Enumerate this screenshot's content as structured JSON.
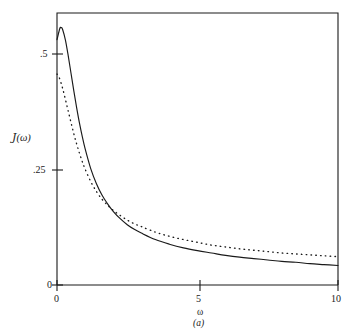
{
  "figure": {
    "caption": "(a)",
    "background_color": "#ffffff",
    "foreground_color": "#1a1a1a"
  },
  "axes": {
    "y_label_prefix": "J",
    "y_label_suffix": "(ω)",
    "x_label": "ω",
    "y_ticks": [
      {
        "value": 0,
        "label": "0"
      },
      {
        "value": 0.25,
        "label": ".25"
      },
      {
        "value": 0.5,
        "label": ".5"
      }
    ],
    "x_ticks": [
      {
        "value": 0,
        "label": "0"
      },
      {
        "value": 5,
        "label": "5"
      },
      {
        "value": 10,
        "label": "10"
      }
    ]
  },
  "chart_data": {
    "type": "line",
    "title": "",
    "subtitle": "(a)",
    "xlabel": "ω",
    "ylabel": "J(ω)",
    "xlim": [
      0,
      10
    ],
    "ylim": [
      0,
      0.5865
    ],
    "xticks": [
      0,
      5,
      10
    ],
    "xticklabels": [
      "0",
      "5",
      "10"
    ],
    "yticks": [
      0,
      0.25,
      0.5
    ],
    "yticklabels": [
      "0",
      ".25",
      ".5"
    ],
    "grid": false,
    "legend": null,
    "legend_position": "none",
    "frame": "box",
    "series": [
      {
        "name": "solid-curve",
        "style": "solid",
        "color": "#1a1a1a",
        "linewidth": 1.1,
        "x": [
          0.0,
          0.1,
          0.15,
          0.2,
          0.3,
          0.4,
          0.5,
          0.6,
          0.7,
          0.8,
          0.9,
          1.0,
          1.2,
          1.4,
          1.6,
          1.8,
          2.0,
          2.25,
          2.5,
          2.75,
          3.0,
          3.5,
          4.0,
          4.5,
          5.0,
          5.5,
          6.0,
          6.5,
          7.0,
          7.5,
          8.0,
          8.5,
          9.0,
          9.5,
          10.0
        ],
        "y": [
          0.529,
          0.553,
          0.555,
          0.551,
          0.528,
          0.494,
          0.456,
          0.418,
          0.382,
          0.349,
          0.32,
          0.294,
          0.251,
          0.219,
          0.194,
          0.175,
          0.159,
          0.143,
          0.13,
          0.12,
          0.112,
          0.098,
          0.088,
          0.08,
          0.074,
          0.069,
          0.064,
          0.06,
          0.057,
          0.054,
          0.051,
          0.049,
          0.046,
          0.044,
          0.042
        ]
      },
      {
        "name": "dotted-curve",
        "style": "dotted",
        "color": "#1a1a1a",
        "linewidth": 1.1,
        "x": [
          0.0,
          0.1,
          0.2,
          0.3,
          0.4,
          0.5,
          0.6,
          0.7,
          0.8,
          0.9,
          1.0,
          1.2,
          1.4,
          1.6,
          1.8,
          2.0,
          2.25,
          2.5,
          2.75,
          3.0,
          3.5,
          4.0,
          4.5,
          5.0,
          5.5,
          6.0,
          6.5,
          7.0,
          7.5,
          8.0,
          8.5,
          9.0,
          9.5,
          10.0
        ],
        "y": [
          0.455,
          0.444,
          0.424,
          0.4,
          0.375,
          0.35,
          0.326,
          0.304,
          0.284,
          0.266,
          0.25,
          0.223,
          0.202,
          0.185,
          0.172,
          0.161,
          0.15,
          0.14,
          0.132,
          0.126,
          0.114,
          0.105,
          0.098,
          0.092,
          0.086,
          0.082,
          0.078,
          0.075,
          0.072,
          0.069,
          0.067,
          0.065,
          0.063,
          0.061
        ]
      }
    ]
  }
}
